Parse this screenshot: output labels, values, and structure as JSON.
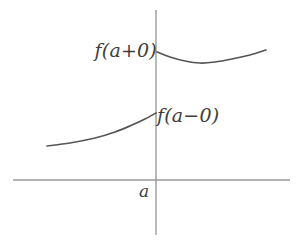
{
  "figure": {
    "kind": "math-plot",
    "background_color": "#ffffff",
    "axis_color": "#9a9a9a",
    "curve_color": "#555555",
    "label_color": "#3d3d3d"
  },
  "labels": {
    "upper_limit": "f(a+0)",
    "lower_limit": "f(a−0)",
    "x_tick": "a"
  },
  "chart_data": {
    "type": "line",
    "title": "",
    "xlabel": "",
    "ylabel": "",
    "grid": false,
    "legend": null,
    "annotations": [
      {
        "text": "f(a+0)",
        "x": 156,
        "y": 52,
        "anchor": "right-of-point-left-side"
      },
      {
        "text": "f(a−0)",
        "x": 156,
        "y": 114,
        "anchor": "right-of-point"
      },
      {
        "text": "a",
        "x": 156,
        "y": 180,
        "anchor": "below-axis-left"
      }
    ],
    "axes": {
      "x_axis": {
        "x_start": 13,
        "x_end": 290,
        "y": 180
      },
      "y_axis": {
        "x": 156,
        "y_start": 10,
        "y_end": 235
      }
    },
    "series": [
      {
        "name": "left-branch",
        "note": "increasing concave-up branch approaching x=a from the left, ending at f(a-0)",
        "points": [
          [
            47,
            146
          ],
          [
            70,
            143
          ],
          [
            95,
            138
          ],
          [
            115,
            132
          ],
          [
            132,
            125
          ],
          [
            145,
            119
          ],
          [
            156,
            113
          ]
        ]
      },
      {
        "name": "right-branch",
        "note": "branch starting at f(a+0) just right of x=a, dipping to a minimum then rising",
        "points": [
          [
            157,
            52
          ],
          [
            170,
            57
          ],
          [
            185,
            61
          ],
          [
            200,
            63
          ],
          [
            215,
            62
          ],
          [
            232,
            59
          ],
          [
            250,
            55
          ],
          [
            266,
            50
          ]
        ]
      }
    ]
  }
}
